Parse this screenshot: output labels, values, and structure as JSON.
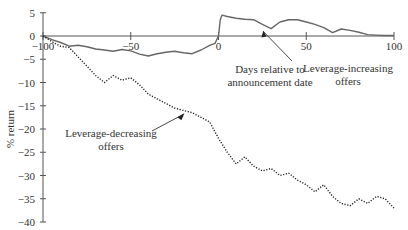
{
  "chart_data": {
    "type": "line",
    "title": "",
    "xlabel": "Days relative to announcement date",
    "ylabel": "% return",
    "xlim": [
      -100,
      100
    ],
    "ylim": [
      -40,
      5
    ],
    "x_ticks": [
      -100,
      -50,
      0,
      50,
      100
    ],
    "y_ticks": [
      5,
      0,
      -5,
      -10,
      -15,
      -20,
      -25,
      -30,
      -35,
      -40
    ],
    "grid": false,
    "legend": "annotations",
    "annotations": [
      {
        "text_lines": [
          "Days relative to",
          "announcement date"
        ],
        "role": "x-axis label"
      },
      {
        "text_lines": [
          "Leverage-increasing",
          "offers"
        ],
        "arrow_to_series": "Leverage-increasing offers",
        "arrow_x": 25
      },
      {
        "text_lines": [
          "Leverage-decreasing",
          "offers"
        ],
        "arrow_to_series": "Leverage-decreasing offers",
        "arrow_x": -20
      }
    ],
    "series": [
      {
        "name": "Leverage-increasing offers",
        "style": "solid",
        "x": [
          -100,
          -95,
          -90,
          -85,
          -80,
          -75,
          -70,
          -65,
          -60,
          -55,
          -50,
          -45,
          -40,
          -35,
          -30,
          -25,
          -20,
          -15,
          -10,
          -5,
          -2,
          0,
          1,
          2,
          5,
          10,
          15,
          20,
          25,
          30,
          35,
          40,
          45,
          50,
          55,
          60,
          65,
          70,
          75,
          80,
          85,
          90,
          95,
          100
        ],
        "values": [
          0,
          -0.8,
          -1.4,
          -2.2,
          -2.0,
          -2.3,
          -2.8,
          -3.0,
          -3.3,
          -2.9,
          -3.2,
          -3.9,
          -4.3,
          -3.8,
          -3.5,
          -3.3,
          -3.6,
          -3.8,
          -3.0,
          -2.0,
          -1.6,
          0,
          3.5,
          4.5,
          4.2,
          3.8,
          3.6,
          3.5,
          2.5,
          1.6,
          3.0,
          3.5,
          3.5,
          3.0,
          2.5,
          1.8,
          0.7,
          1.5,
          1.2,
          0.8,
          0.3,
          0.2,
          0.1,
          0.1
        ]
      },
      {
        "name": "Leverage-decreasing offers",
        "style": "dotted",
        "x": [
          -100,
          -95,
          -90,
          -85,
          -80,
          -75,
          -70,
          -65,
          -60,
          -55,
          -50,
          -45,
          -40,
          -35,
          -30,
          -25,
          -20,
          -15,
          -10,
          -5,
          0,
          5,
          10,
          15,
          20,
          25,
          30,
          35,
          40,
          45,
          50,
          55,
          60,
          65,
          70,
          75,
          80,
          85,
          90,
          95,
          100
        ],
        "values": [
          0,
          -1.2,
          -2.2,
          -2.5,
          -4.5,
          -6.5,
          -8.5,
          -10.0,
          -8.5,
          -9.5,
          -9.0,
          -10.5,
          -12.5,
          -13.5,
          -14.5,
          -15.5,
          -16.0,
          -16.5,
          -17.5,
          -18.5,
          -22.0,
          -25.0,
          -27.5,
          -26.0,
          -28.0,
          -29.0,
          -28.5,
          -30.0,
          -29.5,
          -31.0,
          -32.0,
          -33.5,
          -32.0,
          -34.5,
          -36.0,
          -36.5,
          -35.0,
          -36.0,
          -34.5,
          -35.0,
          -37.0
        ]
      }
    ]
  }
}
